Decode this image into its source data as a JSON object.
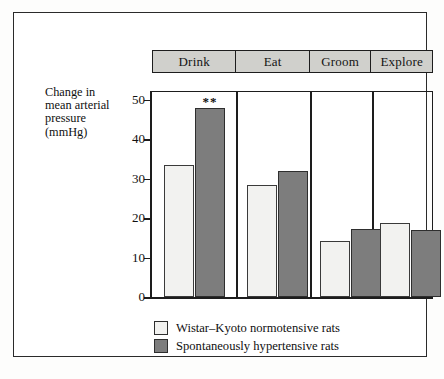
{
  "chart_data": {
    "type": "bar",
    "title": "",
    "xlabel": "",
    "ylabel": "Change in mean arterial pressure (mmHg)",
    "ylabel_lines": [
      "Change in",
      "mean arterial",
      "pressure",
      "(mmHg)"
    ],
    "categories": [
      "Drink",
      "Eat",
      "Groom",
      "Explore"
    ],
    "series": [
      {
        "name": "Wistar–Kyoto normotensive rats",
        "color": "#f2f2f0",
        "values": [
          33.5,
          28.3,
          14.2,
          18.7
        ]
      },
      {
        "name": "Spontaneously hypertensive rats",
        "color": "#7d7d7d",
        "values": [
          48.0,
          32.0,
          17.3,
          17.1
        ]
      }
    ],
    "ylim": [
      0,
      50
    ],
    "yticks": [
      0,
      10,
      20,
      30,
      40,
      50
    ],
    "ytick_labels": [
      "0",
      "10",
      "20",
      "30",
      "40",
      "50"
    ],
    "grid": false,
    "legend_position": "below-left",
    "annotations": [
      {
        "text": "**",
        "category": "Drink",
        "series": "Spontaneously hypertensive rats",
        "value": 48.0
      }
    ]
  },
  "header": {
    "cells": [
      {
        "label": "Drink"
      },
      {
        "label": "Eat"
      },
      {
        "label": "Groom"
      },
      {
        "label": "Explore"
      }
    ]
  },
  "legend": {
    "entries": [
      {
        "label": "Wistar–Kyoto normotensive rats",
        "swatch": "light"
      },
      {
        "label": "Spontaneously hypertensive rats",
        "swatch": "dark"
      }
    ]
  },
  "colors": {
    "light_bar": "#f2f2f0",
    "dark_bar": "#7d7d7d",
    "header_bar": "#d0d0cc",
    "ink": "#1d1d1d",
    "background": "#ffffff"
  }
}
